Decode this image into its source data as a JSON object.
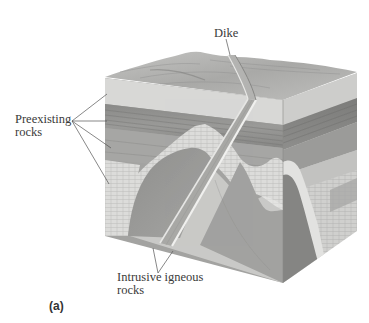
{
  "figure": {
    "panel_letter": "(a)"
  },
  "labels": {
    "dike": "Dike",
    "preexisting": {
      "line1": "Preexisting",
      "line2": "rocks"
    },
    "intrusive": {
      "line1": "Intrusive igneous",
      "line2": "rocks"
    }
  },
  "colors": {
    "background": "#ffffff",
    "top_surface": "#b8b8b8",
    "light_layer": "#d9d9d7",
    "dark_layer": "#8e8e8c",
    "mid_layer": "#a7a7a5",
    "pale_band": "#e4e4e2",
    "intrusive_body": "#9b9b99",
    "dike": "#a9a9a7",
    "dike_edge": "#ededeb",
    "leader_line": "#555555",
    "text": "#3a3a3a"
  }
}
